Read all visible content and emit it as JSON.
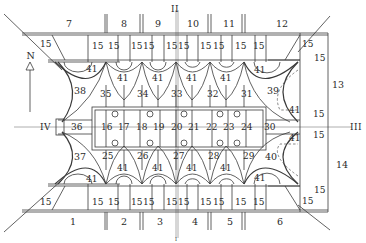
{
  "diagram": {
    "type": "architectural-floor-plan",
    "orientation_label": "N",
    "axis_labels": {
      "top": "II",
      "bottom": "I",
      "left": "IV",
      "right": "III"
    },
    "colors": {
      "line": "#3a3a3a",
      "axis": "#9a9a9a",
      "background": "#ffffff",
      "text": "#2a2a2a"
    },
    "top_bays": [
      "7",
      "8",
      "9",
      "10",
      "11",
      "12"
    ],
    "bottom_bays": [
      "1",
      "2",
      "3",
      "4",
      "5",
      "6"
    ],
    "right_bays": [
      "13",
      "14"
    ],
    "small_room_label": "15",
    "vault_label": "41",
    "upper_chambers": [
      "35",
      "34",
      "33",
      "32",
      "31"
    ],
    "lower_chambers": [
      "25",
      "26",
      "27",
      "28",
      "29"
    ],
    "central_row": [
      "36",
      "16",
      "17",
      "18",
      "19",
      "20",
      "21",
      "22",
      "23",
      "24",
      "30"
    ],
    "corner_halls": {
      "top_left": "38",
      "top_right": "39",
      "bottom_left": "37",
      "bottom_right": "40"
    }
  }
}
